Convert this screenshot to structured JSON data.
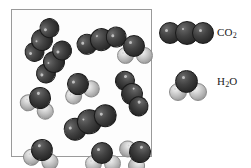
{
  "figure": {
    "background_color": "#ffffff",
    "box": {
      "border_color": "#9a9a9a",
      "fill_color": "#fdfdfd",
      "x": 11,
      "y": 9,
      "width": 141,
      "height": 148
    },
    "atom_colors": {
      "dark_sphere": "#3a3a3a",
      "light_sphere": "#c2c2c2",
      "highlight": "#cfcfcf",
      "outline": "#1a1a1a"
    }
  },
  "legend": {
    "items": [
      {
        "key": "co2",
        "label_text": "CO2",
        "label_base": "CO",
        "label_sub": "2",
        "model": "carbon-dioxide-space-filling",
        "atom_count": 3,
        "description": "Three dark spheres in a linear row"
      },
      {
        "key": "h2o",
        "label_text": "H2O",
        "label_base_1": "H",
        "label_sub": "2",
        "label_base_2": "O",
        "model": "water-space-filling",
        "atom_count": 3,
        "description": "One dark sphere with two light gray spheres"
      }
    ]
  },
  "box_contents": {
    "co2_count": 8,
    "h2o_count": 7,
    "molecules": [
      {
        "id": "co2-1",
        "type": "co2",
        "x": 30,
        "y": 30,
        "rotation": -58,
        "scale": 1.0
      },
      {
        "id": "co2-2",
        "type": "co2",
        "x": 42,
        "y": 50,
        "rotation": -55,
        "scale": 1.0
      },
      {
        "id": "co2-3",
        "type": "co2",
        "x": 90,
        "y": 28,
        "rotation": -14,
        "scale": 1.05
      },
      {
        "id": "h2o-1",
        "type": "h2o",
        "x": 134,
        "y": 34,
        "rotation": 0,
        "scale": 1.0
      },
      {
        "id": "h2o-2",
        "type": "h2o",
        "x": 74,
        "y": 72,
        "rotation": -20,
        "scale": 1.0
      },
      {
        "id": "co2-4",
        "type": "co2",
        "x": 124,
        "y": 82,
        "rotation": 62,
        "scale": 1.02
      },
      {
        "id": "h2o-3",
        "type": "h2o",
        "x": 30,
        "y": 88,
        "rotation": 28,
        "scale": 1.0
      },
      {
        "id": "co2-5",
        "type": "co2",
        "x": 82,
        "y": 110,
        "rotation": -24,
        "scale": 1.12
      },
      {
        "id": "h2o-4",
        "type": "h2o",
        "x": 30,
        "y": 140,
        "rotation": 14,
        "scale": 1.0
      },
      {
        "id": "h2o-5",
        "type": "h2o",
        "x": 92,
        "y": 146,
        "rotation": 0,
        "scale": 1.0
      },
      {
        "id": "h2o-6",
        "type": "h2o",
        "x": 132,
        "y": 142,
        "rotation": 58,
        "scale": 1.0
      }
    ]
  }
}
